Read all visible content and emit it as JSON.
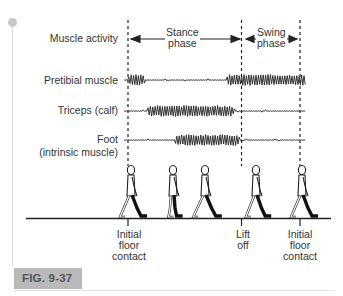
{
  "figure": {
    "caption_label": "FIG. 9-37",
    "row_labels": {
      "header": "Muscle activity",
      "pretibial": "Pretibial muscle",
      "triceps": "Triceps (calf)",
      "foot_line1": "Foot",
      "foot_line2": "(intrinsic muscle)"
    },
    "phases": {
      "stance_line1": "Stance",
      "stance_line2": "phase",
      "swing_line1": "Swing",
      "swing_line2": "phase"
    },
    "events": [
      {
        "line1": "Initial",
        "line2": "floor",
        "line3": "contact"
      },
      {
        "line1": "Lift",
        "line2": "off",
        "line3": ""
      },
      {
        "line1": "Initial",
        "line2": "floor",
        "line3": "contact"
      }
    ],
    "gait_cycle_fractions": {
      "initial_contact": 0,
      "lift_off": 0.66,
      "next_initial_contact": 1.0
    },
    "emg_activity": [
      {
        "muscle": "Pretibial muscle",
        "bursts": [
          [
            0,
            0.1
          ],
          [
            0.57,
            1.05
          ]
        ]
      },
      {
        "muscle": "Triceps (calf)",
        "bursts": [
          [
            0.11,
            0.62
          ]
        ]
      },
      {
        "muscle": "Foot (intrinsic muscle)",
        "bursts": [
          [
            0.27,
            0.65
          ]
        ]
      }
    ],
    "colors": {
      "ink": "#222222",
      "caption_bg": "#b9b9b9",
      "caption_text": "#555555",
      "accent_dot": "#c8c8c8"
    }
  }
}
